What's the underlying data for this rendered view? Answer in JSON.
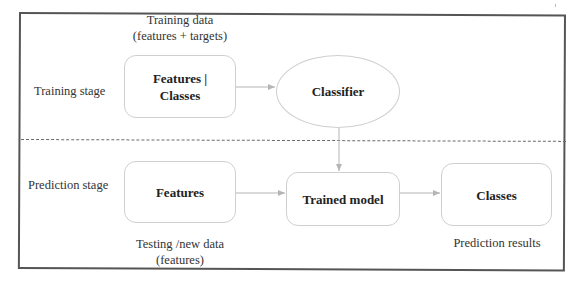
{
  "diagram": {
    "stages": {
      "training": {
        "label": "Training stage"
      },
      "prediction": {
        "label": "Prediction stage"
      }
    },
    "captions": {
      "training_data": {
        "line1": "Training data",
        "line2": "(features + targets)"
      },
      "testing_data": {
        "line1": "Testing /new data",
        "line2": "(features)"
      },
      "prediction_results": {
        "line1": "Prediction results"
      }
    },
    "nodes": {
      "training_features": {
        "line1": "Features |",
        "line2": "Classes",
        "shape": "rounded-rect"
      },
      "classifier": {
        "label": "Classifier",
        "shape": "ellipse"
      },
      "prediction_features": {
        "label": "Features",
        "shape": "rounded-rect"
      },
      "trained_model": {
        "label": "Trained model",
        "shape": "rounded-rect"
      },
      "classes": {
        "label": "Classes",
        "shape": "rounded-rect"
      }
    },
    "edges": [
      {
        "from": "training_features",
        "to": "classifier"
      },
      {
        "from": "classifier",
        "to": "trained_model"
      },
      {
        "from": "prediction_features",
        "to": "trained_model"
      },
      {
        "from": "trained_model",
        "to": "classes"
      }
    ],
    "colors": {
      "frame": "#555555",
      "divider": "#6a6a6a",
      "node_border": "#cfcfcf",
      "arrow": "#b5b5b5",
      "text": "#222222"
    }
  }
}
